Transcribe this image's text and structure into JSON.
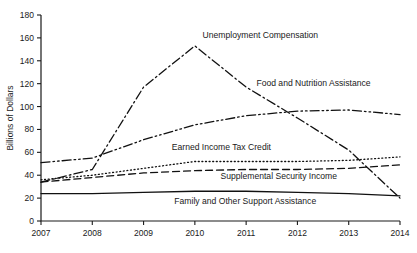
{
  "chart_data": {
    "type": "line",
    "title": "",
    "xlabel": "",
    "ylabel": "Billions of Dollars",
    "x": [
      2007,
      2008,
      2009,
      2010,
      2011,
      2012,
      2013,
      2014
    ],
    "xtick_labels": [
      "2007",
      "2008",
      "2009",
      "2010",
      "2011",
      "2012",
      "2013",
      "2014"
    ],
    "xlim": [
      2007,
      2014
    ],
    "ylim": [
      0,
      180
    ],
    "ytick_labels": [
      "0",
      "20",
      "40",
      "60",
      "80",
      "100",
      "120",
      "140",
      "160",
      "180"
    ],
    "yticks": [
      0,
      20,
      40,
      60,
      80,
      100,
      120,
      140,
      160,
      180
    ],
    "grid": false,
    "legend_position": "inline-annotations",
    "series": [
      {
        "name": "Unemployment Compensation",
        "dash": "dash-dot",
        "label_x": 2010.15,
        "label_y": 160,
        "values": [
          34,
          45,
          117,
          153,
          117,
          90,
          62,
          20
        ]
      },
      {
        "name": "Food and Nutrition Assistance",
        "dash": "dash-dot-dot",
        "label_x": 2011.2,
        "label_y": 118,
        "values": [
          51,
          55,
          71,
          84,
          92,
          96,
          97,
          93
        ]
      },
      {
        "name": "Earned Income Tax Credit",
        "dash": "dotted",
        "label_x": 2009.55,
        "label_y": 62,
        "values": [
          36,
          40,
          46,
          52,
          52,
          52,
          53,
          56
        ]
      },
      {
        "name": "Supplemental Security Income",
        "dash": "dashed",
        "label_x": 2010.5,
        "label_y": 37,
        "values": [
          34,
          38,
          42,
          44,
          45,
          45,
          46,
          49
        ]
      },
      {
        "name": "Family and Other Support Assistance",
        "dash": "solid",
        "label_x": 2009.6,
        "label_y": 15,
        "values": [
          24,
          24,
          25,
          26,
          26,
          25,
          24,
          22
        ]
      }
    ],
    "colors": {
      "line": "#111111",
      "axis": "#1a1a1a",
      "background": "#ffffff"
    }
  }
}
